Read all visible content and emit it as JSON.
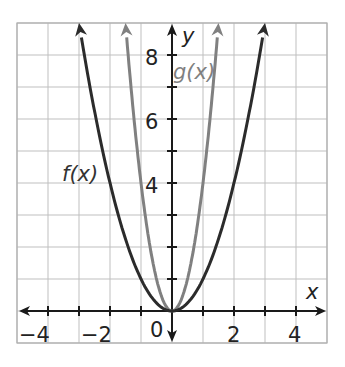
{
  "chart_data": {
    "type": "line",
    "title": "",
    "xlabel": "x",
    "ylabel": "y",
    "xlim": [
      -5,
      5
    ],
    "ylim": [
      -1,
      9
    ],
    "grid": true,
    "x_ticks": [
      -4,
      -2,
      0,
      2,
      4
    ],
    "y_ticks": [
      4,
      6,
      8
    ],
    "x_tick_labels": [
      "−4",
      "−2",
      "0",
      "2",
      "4"
    ],
    "y_tick_labels": [
      "4",
      "6",
      "8"
    ],
    "series": [
      {
        "name": "f(x)",
        "label": "f(x)",
        "expression": "x^2",
        "color": "#2b2b2b",
        "x": [
          -3,
          -2,
          -1,
          0,
          1,
          2,
          3
        ],
        "values": [
          9,
          4,
          1,
          0,
          1,
          4,
          9
        ]
      },
      {
        "name": "g(x)",
        "label": "g(x)",
        "expression": "4x^2",
        "color": "#808080",
        "x": [
          -1.5,
          -1,
          -0.5,
          0,
          0.5,
          1,
          1.5
        ],
        "values": [
          9,
          4,
          1,
          0,
          1,
          4,
          9
        ]
      }
    ],
    "annotations": [
      "f(x)",
      "g(x)"
    ]
  },
  "labels": {
    "x_axis": "x",
    "y_axis": "y",
    "origin": "0",
    "f_label": "f(x)",
    "g_label": "g(x)",
    "xticks": [
      "−4",
      "−2",
      "2",
      "4"
    ],
    "yticks": [
      "4",
      "6",
      "8"
    ]
  }
}
